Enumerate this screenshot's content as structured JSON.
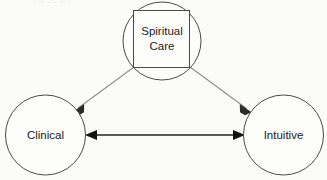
{
  "figure": {
    "background_color": "#fbfbfa",
    "width": 327,
    "height": 180
  },
  "nodes": {
    "spiritual_care": {
      "label_line1": "Spiritual",
      "label_line2": "Care",
      "shape": "square-over-circle"
    },
    "clinical": {
      "label": "Clinical",
      "shape": "circle"
    },
    "intuitive": {
      "label": "Intuitive",
      "shape": "circle"
    }
  },
  "connectors": {
    "spiritual_to_clinical": {
      "style": "single-arrow",
      "color": "#8d8d8d"
    },
    "spiritual_to_intuitive": {
      "style": "single-arrow",
      "color": "#8d8d8d"
    },
    "clinical_intuitive": {
      "style": "double-arrow",
      "color": "#222222"
    }
  },
  "artifacts": {
    "top_cropped_text": "· ·  · ·   ·  ·"
  }
}
